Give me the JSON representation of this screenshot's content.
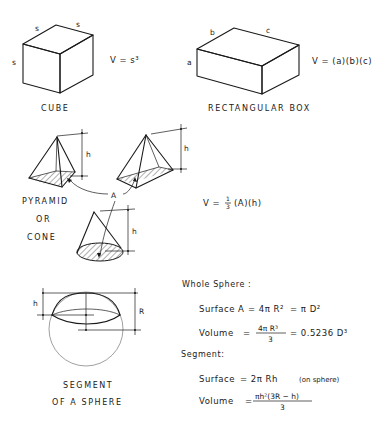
{
  "cube": {
    "edge_top_left": "s",
    "edge_top_right": "s",
    "edge_left": "s",
    "formula": "V = s³",
    "caption": "CUBE"
  },
  "box": {
    "edge_a": "a",
    "edge_b": "b",
    "edge_c": "c",
    "formula": "V = (a)(b)(c)",
    "caption": "RECTANGULAR BOX"
  },
  "pyramid_cone": {
    "height_label_1": "h",
    "height_label_2": "h",
    "height_label_3": "h",
    "base_label": "A",
    "caption_line1": "PYRAMID",
    "caption_line2": "OR",
    "caption_line3": "CONE",
    "formula_prefix": "V =",
    "formula_num": "1",
    "formula_den": "3",
    "formula_suffix": "(A)(h)"
  },
  "sphere": {
    "height_label": "h",
    "radius_label": "R",
    "caption_line1": "SEGMENT",
    "caption_line2": "OF A SPHERE",
    "whole_heading": "Whole Sphere :",
    "whole_surface_label": "Surface A",
    "whole_surface_eq1": "= 4π R²",
    "whole_surface_eq2": "= π D²",
    "whole_volume_label": "Volume",
    "whole_volume_eq": "=",
    "whole_volume_num": "4π R³",
    "whole_volume_den": "3",
    "whole_volume_eq2": "= 0.5236 D³",
    "segment_heading": "Segment:",
    "segment_surface_label": "Surface",
    "segment_surface_eq": "= 2π Rh",
    "segment_surface_note": "(on sphere)",
    "segment_volume_label": "Volume",
    "segment_volume_eq": "=",
    "segment_volume_num": "πh²(3R − h)",
    "segment_volume_den": "3"
  }
}
